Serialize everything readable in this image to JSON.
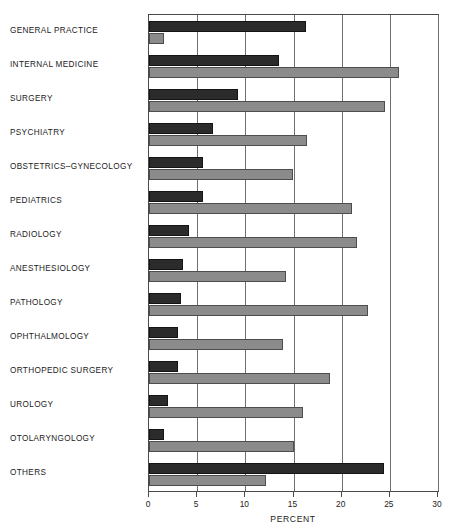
{
  "chart_data": {
    "type": "bar",
    "orientation": "horizontal",
    "title": "",
    "xlabel": "PERCENT",
    "ylabel": "",
    "xlim": [
      0,
      30
    ],
    "xticks": [
      0,
      5,
      10,
      15,
      20,
      25,
      30
    ],
    "xtick_labels": [
      "0",
      "5",
      "10",
      "15",
      "20",
      "25",
      "30"
    ],
    "grid": true,
    "legend": "none",
    "categories": [
      "GENERAL PRACTICE",
      "INTERNAL MEDICINE",
      "SURGERY",
      "PSYCHIATRY",
      "OBSTETRICS–GYNECOLOGY",
      "PEDIATRICS",
      "RADIOLOGY",
      "ANESTHESIOLOGY",
      "PATHOLOGY",
      "OPHTHALMOLOGY",
      "ORTHOPEDIC SURGERY",
      "UROLOGY",
      "OTOLARYNGOLOGY",
      "OTHERS"
    ],
    "series": [
      {
        "name": "series-dark",
        "color": "#2b2b2b",
        "values": [
          16.3,
          13.5,
          9.2,
          6.6,
          5.6,
          5.6,
          4.2,
          3.5,
          3.3,
          3.0,
          3.0,
          2.0,
          1.6,
          24.4
        ]
      },
      {
        "name": "series-light",
        "color": "#8b8b8b",
        "values": [
          1.6,
          25.9,
          24.5,
          16.4,
          14.9,
          21.1,
          21.6,
          14.2,
          22.7,
          13.9,
          18.8,
          16.0,
          15.1,
          12.1
        ]
      }
    ]
  }
}
